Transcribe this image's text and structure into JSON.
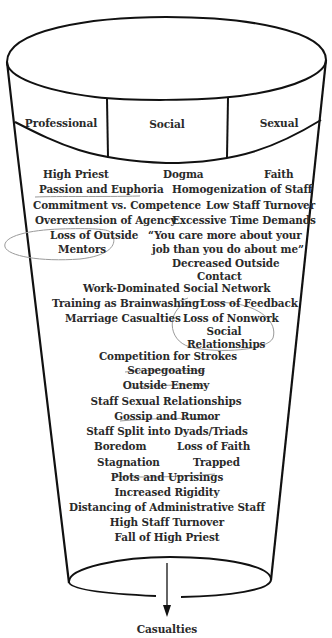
{
  "diagram": {
    "columns": [
      {
        "label": "Professional"
      },
      {
        "label": "Social"
      },
      {
        "label": "Sexual"
      }
    ],
    "stages": [
      {
        "id": "high-priest",
        "text": "High Priest"
      },
      {
        "id": "dogma",
        "text": "Dogma"
      },
      {
        "id": "faith",
        "text": "Faith"
      },
      {
        "id": "passion-euphoria",
        "text": "Passion and Euphoria",
        "annotation": "underline"
      },
      {
        "id": "homogenization",
        "text": "Homogenization of Staff"
      },
      {
        "id": "commitment-competence",
        "text": "Commitment vs. Competence"
      },
      {
        "id": "low-turnover",
        "text": "Low Staff Turnover"
      },
      {
        "id": "overextension",
        "text": "Overextension of Agency"
      },
      {
        "id": "excessive-time",
        "text": "Excessive Time Demands"
      },
      {
        "id": "loss-mentors-1",
        "text": "Loss of Outside",
        "annotation": "circled"
      },
      {
        "id": "loss-mentors-2",
        "text": "Mentors",
        "annotation": "circled"
      },
      {
        "id": "quote-1",
        "text": "“You care more about your"
      },
      {
        "id": "quote-2",
        "text": "job than you do about me”"
      },
      {
        "id": "decreased-contact-1",
        "text": "Decreased Outside"
      },
      {
        "id": "decreased-contact-2",
        "text": "Contact"
      },
      {
        "id": "work-network",
        "text": "Work-Dominated Social Network"
      },
      {
        "id": "training",
        "text": "Training as Brainwashing"
      },
      {
        "id": "loss-feedback",
        "text": "Loss of Feedback"
      },
      {
        "id": "marriage",
        "text": "Marriage Casualties"
      },
      {
        "id": "loss-nonwork-1",
        "text": "Loss of Nonwork",
        "annotation": "circled"
      },
      {
        "id": "loss-nonwork-2",
        "text": "Social",
        "annotation": "circled"
      },
      {
        "id": "loss-nonwork-3",
        "text": "Relationships",
        "annotation": "circled"
      },
      {
        "id": "competition",
        "text": "Competition for Strokes"
      },
      {
        "id": "scapegoating",
        "text": "Scapegoating",
        "annotation": "underline"
      },
      {
        "id": "outside-enemy",
        "text": "Outside Enemy",
        "annotation": "underline"
      },
      {
        "id": "staff-sexual",
        "text": "Staff Sexual Relationships"
      },
      {
        "id": "gossip",
        "text": "Gossip and Rumor",
        "annotation": "underline"
      },
      {
        "id": "dyads",
        "text": "Staff Split into Dyads/Triads"
      },
      {
        "id": "boredom",
        "text": "Boredom"
      },
      {
        "id": "loss-faith",
        "text": "Loss of Faith"
      },
      {
        "id": "stagnation",
        "text": "Stagnation"
      },
      {
        "id": "trapped",
        "text": "Trapped"
      },
      {
        "id": "plots",
        "text": "Plots and Uprisings",
        "annotation": "underline"
      },
      {
        "id": "rigidity",
        "text": "Increased Rigidity"
      },
      {
        "id": "distancing",
        "text": "Distancing of Administrative Staff"
      },
      {
        "id": "high-turnover",
        "text": "High Staff Turnover"
      },
      {
        "id": "fall-priest",
        "text": "Fall of High Priest"
      }
    ],
    "outcome": {
      "label": "Casualties"
    },
    "colors": {
      "ink": "#111111",
      "text": "#2a2a2a",
      "pencil": "#9a9a9a",
      "background": "#ffffff"
    }
  }
}
